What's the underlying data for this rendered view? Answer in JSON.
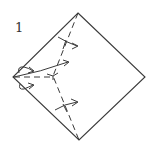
{
  "diagram": {
    "type": "origami-fold-step",
    "step_number": "1",
    "colors": {
      "line": "#3a3a3a",
      "background": "#ffffff"
    },
    "elements": [
      {
        "name": "square-paper",
        "kind": "diamond-outline"
      },
      {
        "name": "valley-fold-line",
        "kind": "dashed-crease"
      },
      {
        "name": "fold-arrow-top",
        "kind": "arrow"
      },
      {
        "name": "fold-arrow-middle",
        "kind": "arrow"
      },
      {
        "name": "fold-arrow-bottom",
        "kind": "arrow"
      },
      {
        "name": "tuck-arrow-upper",
        "kind": "curl-arrow"
      },
      {
        "name": "tuck-arrow-lower",
        "kind": "curl-arrow"
      }
    ]
  }
}
